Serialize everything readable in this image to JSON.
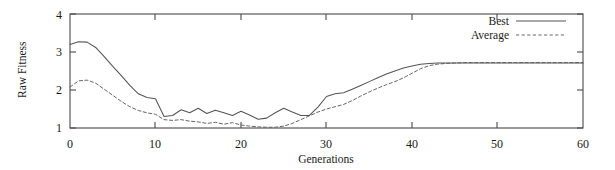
{
  "chart_data": {
    "type": "line",
    "title": "",
    "xlabel": "Generations",
    "ylabel": "Raw Fitness",
    "xlim": [
      0,
      60
    ],
    "ylim": [
      1,
      4
    ],
    "xticks": [
      0,
      10,
      20,
      30,
      40,
      50,
      60
    ],
    "yticks": [
      1,
      2,
      3,
      4
    ],
    "grid": false,
    "legend_position": "top-right",
    "x": [
      0,
      1,
      2,
      3,
      4,
      5,
      6,
      7,
      8,
      9,
      10,
      11,
      12,
      13,
      14,
      15,
      16,
      17,
      18,
      19,
      20,
      21,
      22,
      23,
      24,
      25,
      26,
      27,
      28,
      29,
      30,
      31,
      32,
      33,
      34,
      35,
      36,
      37,
      38,
      39,
      40,
      41,
      42,
      43,
      44,
      45,
      46,
      47,
      48,
      49,
      50,
      51,
      52,
      53,
      54,
      55,
      56,
      57,
      58,
      59,
      60
    ],
    "series": [
      {
        "name": "Best",
        "style": "solid",
        "color": "#555555",
        "values": [
          3.2,
          3.27,
          3.26,
          3.12,
          2.88,
          2.62,
          2.38,
          2.12,
          1.9,
          1.8,
          1.77,
          1.3,
          1.33,
          1.48,
          1.4,
          1.52,
          1.38,
          1.47,
          1.4,
          1.33,
          1.44,
          1.34,
          1.23,
          1.26,
          1.4,
          1.52,
          1.42,
          1.33,
          1.33,
          1.55,
          1.83,
          1.9,
          1.93,
          2.02,
          2.12,
          2.22,
          2.32,
          2.42,
          2.5,
          2.58,
          2.63,
          2.68,
          2.7,
          2.71,
          2.71,
          2.71,
          2.71,
          2.71,
          2.71,
          2.71,
          2.71,
          2.71,
          2.71,
          2.71,
          2.71,
          2.71,
          2.71,
          2.71,
          2.71,
          2.71,
          2.71
        ]
      },
      {
        "name": "Average",
        "style": "dashed",
        "color": "#666666",
        "values": [
          2.08,
          2.24,
          2.26,
          2.18,
          2.02,
          1.86,
          1.7,
          1.56,
          1.46,
          1.4,
          1.36,
          1.22,
          1.2,
          1.22,
          1.18,
          1.16,
          1.12,
          1.15,
          1.1,
          1.14,
          1.08,
          1.05,
          1.03,
          1.02,
          1.02,
          1.05,
          1.12,
          1.22,
          1.32,
          1.42,
          1.5,
          1.56,
          1.62,
          1.72,
          1.84,
          1.95,
          2.05,
          2.14,
          2.22,
          2.32,
          2.44,
          2.56,
          2.64,
          2.68,
          2.7,
          2.71,
          2.72,
          2.72,
          2.72,
          2.72,
          2.72,
          2.72,
          2.72,
          2.72,
          2.72,
          2.72,
          2.72,
          2.72,
          2.72,
          2.72,
          2.72
        ]
      }
    ]
  },
  "legend": {
    "best_label": "Best",
    "average_label": "Average"
  },
  "axes": {
    "y_label": "Raw Fitness",
    "x_label": "Generations",
    "y_tick_labels": [
      "1",
      "2",
      "3",
      "4"
    ],
    "x_tick_labels": [
      "0",
      "10",
      "20",
      "30",
      "40",
      "50",
      "60"
    ]
  }
}
